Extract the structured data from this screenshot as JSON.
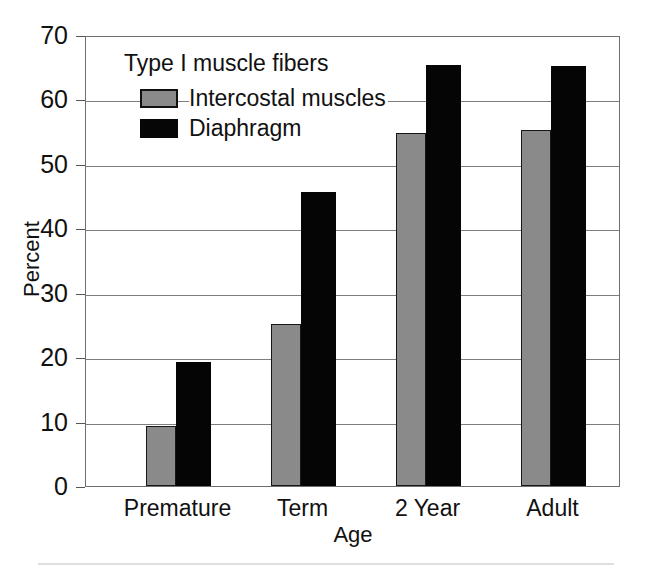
{
  "chart_data": {
    "type": "bar",
    "title": "",
    "legend_title": "Type I muscle fibers",
    "legend_position": "inside-top-left",
    "xlabel": "Age",
    "ylabel": "Percent",
    "categories": [
      "Premature",
      "Term",
      "2 Year",
      "Adult"
    ],
    "series": [
      {
        "name": "Intercostal muscles",
        "color": "#8a8a8a",
        "values": [
          9.3,
          25.1,
          54.8,
          55.2
        ]
      },
      {
        "name": "Diaphragm",
        "color": "#050505",
        "values": [
          19.2,
          45.7,
          65.4,
          65.2
        ]
      }
    ],
    "ylim": [
      0,
      70
    ],
    "ytick_values": [
      0,
      10,
      20,
      30,
      40,
      50,
      60,
      70
    ],
    "ytick_labels": [
      "0",
      "10",
      "20",
      "30",
      "40",
      "50",
      "60",
      "70"
    ],
    "grid": true,
    "grid_axis": "y"
  }
}
